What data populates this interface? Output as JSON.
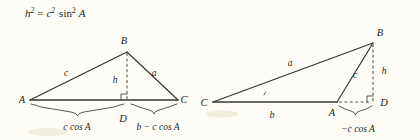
{
  "page": {
    "background_color": "#fdfcf6",
    "ink_color": "#32322e",
    "width": 420,
    "height": 140
  },
  "formula": {
    "name": "height-squared-identity",
    "full_text": "h² = c² sin² A",
    "lhs_base": "h",
    "lhs_exponent": "2",
    "equals": "=",
    "rhs_coefficient_base": "c",
    "rhs_coefficient_exponent": "2",
    "rhs_function": "sin",
    "rhs_function_exponent": "2",
    "rhs_argument": "A"
  },
  "figures": [
    {
      "id": "acute-triangle",
      "caption_role": "acute-case",
      "vertices": [
        {
          "label": "A",
          "x": 30,
          "y": 100,
          "label_x": 22,
          "label_y": 103
        },
        {
          "label": "B",
          "x": 127,
          "y": 52,
          "label_x": 124,
          "label_y": 44
        },
        {
          "label": "C",
          "x": 178,
          "y": 100,
          "label_x": 182,
          "label_y": 103
        },
        {
          "label": "D",
          "x": 127,
          "y": 100,
          "label_x": 123,
          "label_y": 122
        }
      ],
      "sides": [
        {
          "label": "c",
          "label_x": 66,
          "label_y": 76
        },
        {
          "label": "a",
          "label_x": 152,
          "label_y": 76
        },
        {
          "label": "h",
          "label_x": 116,
          "label_y": 82
        }
      ],
      "right_angle_marker": {
        "x": 127,
        "y": 100,
        "size": 6
      },
      "braces": [
        {
          "name": "brace-c-cos-a",
          "label": "c cos A",
          "from_x": 31,
          "to_x": 124,
          "y": 106,
          "label_x": 77,
          "label_y": 128
        },
        {
          "name": "brace-b-minus-c-cos-a",
          "label": "b − c cos A",
          "from_x": 130,
          "to_x": 177,
          "y": 106,
          "label_x": 154,
          "label_y": 128
        }
      ]
    },
    {
      "id": "obtuse-triangle",
      "caption_role": "obtuse-case",
      "vertices": [
        {
          "label": "C",
          "x": 213,
          "y": 102,
          "label_x": 204,
          "label_y": 105
        },
        {
          "label": "B",
          "x": 373,
          "y": 43,
          "label_x": 377,
          "label_y": 36
        },
        {
          "label": "A",
          "x": 337,
          "y": 102,
          "label_x": 332,
          "label_y": 115
        },
        {
          "label": "D",
          "x": 373,
          "y": 102,
          "label_x": 380,
          "label_y": 105
        }
      ],
      "sides": [
        {
          "label": "a",
          "label_x": 290,
          "label_y": 66
        },
        {
          "label": "b",
          "label_x": 272,
          "label_y": 117
        },
        {
          "label": "c",
          "label_x": 355,
          "label_y": 76
        },
        {
          "label": "h",
          "label_x": 382,
          "label_y": 73
        }
      ],
      "right_angle_marker": {
        "x": 373,
        "y": 102,
        "size": 6
      },
      "angle_tick": {
        "x": 264,
        "y": 94
      },
      "braces": [
        {
          "name": "brace-neg-c-cos-a",
          "label": "−c cos A",
          "from_x": 339,
          "to_x": 372,
          "y": 107,
          "label_x": 355,
          "label_y": 130
        }
      ]
    }
  ]
}
